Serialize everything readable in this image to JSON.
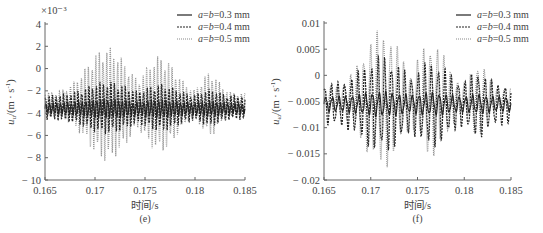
{
  "chart_data": [
    {
      "id": "e",
      "type": "line",
      "caption": "(e)",
      "title": "",
      "xlabel": "时间/s",
      "ylabel": "u_u/(m·s⁻¹)",
      "ylabel_main": "u",
      "ylabel_sub": "u",
      "ylabel_unit": "/(m · s",
      "ylabel_exp": "-1",
      "ylabel_close": ")",
      "y_multiplier": "×10⁻³",
      "xlim": [
        0.165,
        0.185
      ],
      "ylim": [
        -10,
        4
      ],
      "xticks": [
        0.165,
        0.17,
        0.175,
        0.18,
        0.185
      ],
      "xtick_labels": [
        "0.165",
        "0.17",
        "0.175",
        "0.18",
        "0.185"
      ],
      "yticks": [
        4,
        2,
        0,
        -2,
        -4,
        -6,
        -8,
        -10
      ],
      "ytick_labels": [
        "4",
        "2",
        "0",
        "− 2",
        "− 4",
        "− 6",
        "− 8",
        "− 10"
      ],
      "grid": false,
      "legend_position": "upper right",
      "series": [
        {
          "name": "a=b=0.3 mm",
          "style": "solid",
          "color": "#222222",
          "mean": -3.6,
          "amp_min": 0.5,
          "amp_max": 0.9,
          "cycles": 55,
          "approx_range": [
            -4.5,
            -2.8
          ]
        },
        {
          "name": "a=b=0.4 mm",
          "style": "dashed",
          "color": "#222222",
          "mean": -3.5,
          "amp_min": 1.1,
          "amp_max": 2.4,
          "cycles": 55,
          "approx_range": [
            -8.3,
            -0.8
          ]
        },
        {
          "name": "a=b=0.5 mm",
          "style": "dotted",
          "color": "#888888",
          "mean": -3.2,
          "amp_min": 1.0,
          "amp_max": 5.2,
          "cycles": 55,
          "approx_range": [
            -8.5,
            2.2
          ]
        }
      ]
    },
    {
      "id": "f",
      "type": "line",
      "caption": "(f)",
      "title": "",
      "xlabel": "时间/s",
      "ylabel": "u_ω/(m·s⁻¹)",
      "ylabel_main": "u",
      "ylabel_sub": "ω",
      "ylabel_unit": "/(m · s",
      "ylabel_exp": "-1",
      "ylabel_close": ")",
      "y_multiplier": "",
      "xlim": [
        0.165,
        0.185
      ],
      "ylim": [
        -0.02,
        0.01
      ],
      "xticks": [
        0.165,
        0.17,
        0.175,
        0.18,
        0.185
      ],
      "xtick_labels": [
        "0.165",
        "0.17",
        "0.175",
        "0.18",
        "0.185"
      ],
      "yticks": [
        0.01,
        0.005,
        0,
        -0.005,
        -0.01,
        -0.015,
        -0.02
      ],
      "ytick_labels": [
        "0.01",
        "0.005",
        "0",
        "− 0.005",
        "− 0.01",
        "− 0.015",
        "− 0.02"
      ],
      "grid": false,
      "legend_position": "upper right",
      "series": [
        {
          "name": "a=b=0.3 mm",
          "style": "solid",
          "color": "#222222",
          "mean": -0.0055,
          "amp_min": 0.0015,
          "amp_max": 0.0025,
          "cycles": 28,
          "approx_range": [
            -0.008,
            -0.003
          ]
        },
        {
          "name": "a=b=0.4 mm",
          "style": "dashed",
          "color": "#222222",
          "mean": -0.0055,
          "amp_min": 0.004,
          "amp_max": 0.0095,
          "cycles": 28,
          "approx_range": [
            -0.0145,
            0.003
          ]
        },
        {
          "name": "a=b=0.5 mm",
          "style": "dotted",
          "color": "#888888",
          "mean": -0.0045,
          "amp_min": 0.002,
          "amp_max": 0.0135,
          "cycles": 28,
          "approx_range": [
            -0.0185,
            0.009
          ]
        }
      ]
    }
  ],
  "legend": {
    "items": [
      {
        "prefix_a": "a",
        "eq1": "=",
        "b": "b",
        "value": "=0.3 mm"
      },
      {
        "prefix_a": "a",
        "eq1": "=",
        "b": "b",
        "value": "=0.4 mm"
      },
      {
        "prefix_a": "a",
        "eq1": "=",
        "b": "b",
        "value": "=0.5 mm"
      }
    ]
  }
}
